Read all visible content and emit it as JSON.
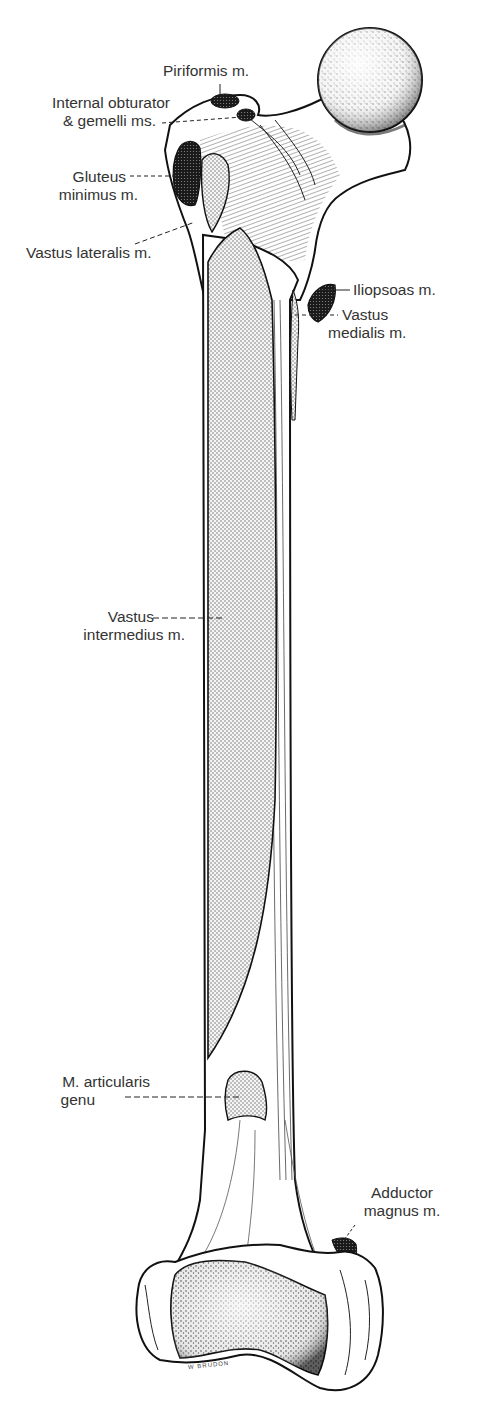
{
  "figure": {
    "colors": {
      "background": "#ffffff",
      "ink": "#1a1a1a",
      "origin_fill_dark": "#2a2a2a",
      "insertion_fill_light": "#d9d9d9",
      "label_text": "#333333"
    },
    "legend_note": "Dark stipple = muscle insertions; light stipple = muscle origins"
  },
  "labels": {
    "piriformis": {
      "lines": [
        "Piriformis m."
      ]
    },
    "internal_obturator": {
      "lines": [
        "Internal obturator",
        "& gemelli ms."
      ]
    },
    "gluteus_minimus": {
      "lines": [
        "Gluteus",
        "minimus m."
      ]
    },
    "vastus_lateralis": {
      "lines": [
        "Vastus lateralis m."
      ]
    },
    "iliopsoas": {
      "lines": [
        "Iliopsoas m."
      ]
    },
    "vastus_medialis": {
      "lines": [
        "Vastus",
        "medialis m."
      ]
    },
    "vastus_intermedius": {
      "lines": [
        "Vastus",
        "intermedius m."
      ]
    },
    "articularis_genu": {
      "lines": [
        "M. articularis",
        "genu"
      ]
    },
    "adductor_magnus": {
      "lines": [
        "Adductor",
        "magnus m."
      ]
    }
  },
  "signature": "W BRUDON"
}
